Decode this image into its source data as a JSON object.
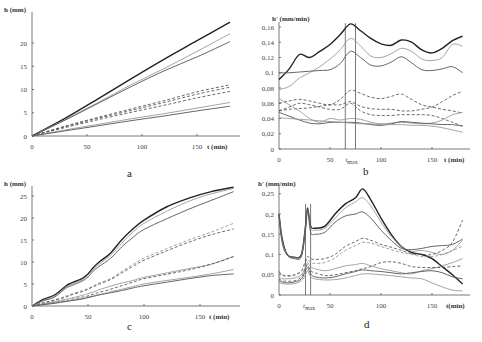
{
  "chart_data": [
    {
      "panel": "a",
      "type": "line",
      "ylabel": "h (mm)",
      "xlabel": "t (min)",
      "xticks": [
        0,
        50,
        100,
        150
      ],
      "yticks": [
        0,
        5,
        10,
        15,
        20
      ],
      "xlim": [
        0,
        180
      ],
      "ylim": [
        0,
        25
      ],
      "grid": false,
      "x": [
        0,
        30,
        60,
        90,
        120,
        150,
        180
      ],
      "series": [
        {
          "name": "s1",
          "style": "solid-bold",
          "values": [
            0,
            3.8,
            8.0,
            12.3,
            16.5,
            20.5,
            24.5
          ]
        },
        {
          "name": "s2",
          "style": "solid-light",
          "values": [
            0,
            3.5,
            7.2,
            11.0,
            14.5,
            18.2,
            22.0
          ]
        },
        {
          "name": "s3",
          "style": "solid",
          "values": [
            0,
            3.4,
            7.0,
            10.6,
            14.0,
            17.0,
            20.3
          ]
        },
        {
          "name": "s4",
          "style": "dashed",
          "values": [
            0,
            2.1,
            4.0,
            5.8,
            7.6,
            9.5,
            11.0
          ]
        },
        {
          "name": "s5",
          "style": "dashed",
          "values": [
            0,
            2.0,
            3.8,
            5.5,
            7.2,
            9.0,
            10.5
          ]
        },
        {
          "name": "s6",
          "style": "dashed",
          "values": [
            0,
            1.8,
            3.5,
            5.1,
            6.6,
            8.2,
            9.6
          ]
        },
        {
          "name": "s7",
          "style": "solid-light",
          "values": [
            0,
            1.3,
            2.5,
            3.7,
            4.8,
            6.0,
            7.2
          ]
        },
        {
          "name": "s8",
          "style": "solid",
          "values": [
            0,
            1.1,
            2.2,
            3.3,
            4.3,
            5.4,
            6.4
          ]
        }
      ]
    },
    {
      "panel": "b",
      "type": "line",
      "ylabel": "h' (mm/min)",
      "xlabel": "t (min)",
      "xticks": [
        0,
        50,
        100,
        150
      ],
      "yticks": [
        "0",
        "0,02",
        "0,04",
        "0,06",
        "0,08",
        "0,1",
        "0,12",
        "0,14",
        "0,16"
      ],
      "xlim": [
        0,
        185
      ],
      "ylim": [
        0,
        0.165
      ],
      "annotation": "t_max",
      "tmax_band": [
        65,
        75
      ],
      "grid": false,
      "x": [
        0,
        10,
        20,
        30,
        40,
        50,
        60,
        70,
        80,
        90,
        100,
        110,
        120,
        130,
        140,
        150,
        160,
        170,
        180
      ],
      "series": [
        {
          "name": "s1",
          "style": "solid-bold",
          "values": [
            0.091,
            0.105,
            0.124,
            0.12,
            0.128,
            0.137,
            0.15,
            0.164,
            0.155,
            0.145,
            0.138,
            0.136,
            0.143,
            0.14,
            0.13,
            0.126,
            0.132,
            0.142,
            0.148
          ]
        },
        {
          "name": "s2",
          "style": "solid-light",
          "values": [
            0.078,
            0.082,
            0.093,
            0.1,
            0.108,
            0.118,
            0.13,
            0.145,
            0.135,
            0.122,
            0.12,
            0.125,
            0.132,
            0.128,
            0.118,
            0.116,
            0.12,
            0.137,
            0.135
          ]
        },
        {
          "name": "s3",
          "style": "solid",
          "values": [
            0.1,
            0.1,
            0.101,
            0.102,
            0.103,
            0.104,
            0.112,
            0.128,
            0.12,
            0.11,
            0.109,
            0.114,
            0.121,
            0.113,
            0.104,
            0.103,
            0.105,
            0.108,
            0.1
          ]
        },
        {
          "name": "s4",
          "style": "dashed",
          "values": [
            0.06,
            0.063,
            0.065,
            0.063,
            0.06,
            0.058,
            0.065,
            0.077,
            0.073,
            0.068,
            0.066,
            0.069,
            0.072,
            0.065,
            0.058,
            0.055,
            0.052,
            0.05,
            0.047
          ]
        },
        {
          "name": "s5",
          "style": "dashed",
          "values": [
            0.05,
            0.052,
            0.053,
            0.054,
            0.056,
            0.058,
            0.058,
            0.062,
            0.056,
            0.053,
            0.052,
            0.052,
            0.05,
            0.05,
            0.052,
            0.055,
            0.062,
            0.07,
            0.076
          ]
        },
        {
          "name": "s6",
          "style": "dashed",
          "values": [
            0.05,
            0.055,
            0.06,
            0.058,
            0.055,
            0.052,
            0.052,
            0.06,
            0.05,
            0.045,
            0.044,
            0.044,
            0.045,
            0.045,
            0.045,
            0.044,
            0.04,
            0.035,
            0.03
          ]
        },
        {
          "name": "s7",
          "style": "solid-light",
          "values": [
            0.066,
            0.058,
            0.05,
            0.04,
            0.035,
            0.04,
            0.038,
            0.04,
            0.039,
            0.035,
            0.033,
            0.034,
            0.035,
            0.034,
            0.033,
            0.034,
            0.038,
            0.045,
            0.048
          ]
        },
        {
          "name": "s8",
          "style": "solid",
          "values": [
            0.048,
            0.043,
            0.038,
            0.034,
            0.033,
            0.035,
            0.035,
            0.035,
            0.034,
            0.032,
            0.031,
            0.033,
            0.036,
            0.035,
            0.034,
            0.033,
            0.032,
            0.032,
            0.03
          ]
        },
        {
          "name": "s9",
          "style": "solid-light",
          "values": [
            0.041,
            0.04,
            0.039,
            0.038,
            0.037,
            0.036,
            0.035,
            0.034,
            0.033,
            0.033,
            0.032,
            0.032,
            0.032,
            0.031,
            0.031,
            0.03,
            0.028,
            0.025,
            0.022
          ]
        }
      ]
    },
    {
      "panel": "c",
      "type": "line",
      "ylabel": "h (mm)",
      "xlabel": "t (min)",
      "xticks": [
        0,
        50,
        100,
        150
      ],
      "yticks": [
        0,
        5,
        10,
        15,
        20,
        25
      ],
      "xlim": [
        0,
        185
      ],
      "ylim": [
        0,
        27
      ],
      "grid": false,
      "x": [
        0,
        10,
        20,
        30,
        35,
        45,
        50,
        55,
        60,
        70,
        80,
        90,
        100,
        120,
        140,
        160,
        180
      ],
      "series": [
        {
          "name": "s1",
          "style": "solid-bold",
          "values": [
            0,
            1.5,
            2.5,
            4.5,
            5.2,
            6.3,
            7.3,
            8.8,
            10.0,
            12.0,
            15.0,
            17.5,
            19.5,
            22.5,
            24.5,
            26.0,
            27.0
          ]
        },
        {
          "name": "s2",
          "style": "solid-light",
          "values": [
            0,
            1.3,
            2.2,
            4.2,
            4.9,
            6.0,
            7.0,
            8.4,
            9.5,
            11.5,
            14.2,
            16.8,
            18.8,
            21.5,
            23.8,
            25.5,
            26.7
          ]
        },
        {
          "name": "s3",
          "style": "solid",
          "values": [
            0,
            1.2,
            2.0,
            4.0,
            4.6,
            5.7,
            6.6,
            8.0,
            9.0,
            10.8,
            13.4,
            15.6,
            17.4,
            19.8,
            22.0,
            24.0,
            26.0
          ]
        },
        {
          "name": "s4",
          "style": "dashed-light",
          "values": [
            0,
            0.8,
            1.4,
            2.2,
            2.7,
            3.5,
            4.0,
            4.6,
            5.2,
            6.2,
            7.8,
            9.4,
            10.9,
            13.0,
            15.0,
            16.8,
            18.8
          ]
        },
        {
          "name": "s5",
          "style": "dashed",
          "values": [
            0,
            0.7,
            1.3,
            2.0,
            2.5,
            3.3,
            3.8,
            4.4,
            5.0,
            6.0,
            7.5,
            9.0,
            10.4,
            12.5,
            14.5,
            16.2,
            17.5
          ]
        },
        {
          "name": "s6",
          "style": "solid-light",
          "values": [
            0,
            0.5,
            1.0,
            1.5,
            1.8,
            2.4,
            2.8,
            3.2,
            3.7,
            4.5,
            5.2,
            5.8,
            6.5,
            7.5,
            8.5,
            9.5,
            11.3
          ]
        },
        {
          "name": "s7",
          "style": "dashed",
          "values": [
            0,
            0.4,
            0.8,
            1.2,
            1.5,
            2.0,
            2.3,
            2.7,
            3.1,
            3.8,
            4.6,
            5.4,
            6.2,
            7.2,
            8.2,
            9.5,
            11.2
          ]
        },
        {
          "name": "s8",
          "style": "solid-light",
          "values": [
            0,
            0.35,
            0.7,
            1.1,
            1.3,
            1.7,
            2.0,
            2.3,
            2.6,
            3.2,
            3.8,
            4.4,
            5.0,
            5.8,
            6.5,
            7.3,
            8.3
          ]
        },
        {
          "name": "s9",
          "style": "solid",
          "values": [
            0,
            0.3,
            0.6,
            1.0,
            1.2,
            1.6,
            1.9,
            2.2,
            2.5,
            3.0,
            3.5,
            4.1,
            4.6,
            5.4,
            6.2,
            6.9,
            7.3
          ]
        }
      ]
    },
    {
      "panel": "d",
      "type": "line",
      "ylabel": "h' (mm/min)",
      "xlabel": "t(min)",
      "xticks": [
        0,
        50,
        100,
        150
      ],
      "yticks": [
        "0",
        "0,05",
        "0,1",
        "0,15",
        "0,2",
        "0,25"
      ],
      "xlim": [
        0,
        185
      ],
      "ylim": [
        0,
        0.27
      ],
      "annotation": "t_max",
      "tmax_band": [
        26,
        31
      ],
      "grid": false,
      "x": [
        0,
        3,
        8,
        15,
        22,
        26,
        28,
        31,
        35,
        45,
        55,
        65,
        75,
        82,
        90,
        100,
        110,
        120,
        130,
        140,
        150,
        160,
        170,
        180
      ],
      "series": [
        {
          "name": "s1",
          "style": "solid-bold",
          "values": [
            0.2,
            0.14,
            0.1,
            0.093,
            0.1,
            0.17,
            0.215,
            0.17,
            0.165,
            0.17,
            0.2,
            0.225,
            0.24,
            0.262,
            0.235,
            0.19,
            0.15,
            0.12,
            0.105,
            0.1,
            0.09,
            0.07,
            0.05,
            0.027
          ]
        },
        {
          "name": "s2",
          "style": "solid-light",
          "values": [
            0.2,
            0.135,
            0.1,
            0.092,
            0.098,
            0.165,
            0.212,
            0.165,
            0.16,
            0.165,
            0.19,
            0.215,
            0.23,
            0.24,
            0.22,
            0.18,
            0.145,
            0.12,
            0.108,
            0.11,
            0.105,
            0.1,
            0.11,
            0.135
          ]
        },
        {
          "name": "s3",
          "style": "solid",
          "values": [
            0.2,
            0.13,
            0.098,
            0.09,
            0.095,
            0.16,
            0.21,
            0.155,
            0.15,
            0.155,
            0.18,
            0.195,
            0.2,
            0.205,
            0.19,
            0.16,
            0.135,
            0.115,
            0.112,
            0.115,
            0.12,
            0.122,
            0.125,
            0.138
          ]
        },
        {
          "name": "s4",
          "style": "dashed",
          "values": [
            0.058,
            0.05,
            0.048,
            0.05,
            0.06,
            0.085,
            0.095,
            0.09,
            0.088,
            0.09,
            0.1,
            0.12,
            0.132,
            0.14,
            0.135,
            0.125,
            0.118,
            0.11,
            0.102,
            0.1,
            0.1,
            0.11,
            0.13,
            0.185
          ]
        },
        {
          "name": "s5",
          "style": "dashed-light",
          "values": [
            0.055,
            0.048,
            0.046,
            0.048,
            0.058,
            0.08,
            0.088,
            0.08,
            0.078,
            0.08,
            0.092,
            0.11,
            0.122,
            0.13,
            0.128,
            0.12,
            0.112,
            0.105,
            0.1,
            0.095,
            0.095,
            0.1,
            0.11,
            0.12
          ]
        },
        {
          "name": "s6",
          "style": "solid-light",
          "values": [
            0.045,
            0.04,
            0.04,
            0.042,
            0.05,
            0.07,
            0.08,
            0.07,
            0.065,
            0.06,
            0.065,
            0.072,
            0.075,
            0.078,
            0.072,
            0.065,
            0.06,
            0.055,
            0.052,
            0.06,
            0.065,
            0.072,
            0.08,
            0.09
          ]
        },
        {
          "name": "s7",
          "style": "dashed",
          "values": [
            0.04,
            0.035,
            0.034,
            0.035,
            0.045,
            0.065,
            0.075,
            0.06,
            0.055,
            0.048,
            0.05,
            0.055,
            0.06,
            0.065,
            0.07,
            0.08,
            0.082,
            0.078,
            0.07,
            0.068,
            0.068,
            0.068,
            0.07,
            0.072
          ]
        },
        {
          "name": "s8",
          "style": "solid",
          "values": [
            0.035,
            0.032,
            0.03,
            0.032,
            0.04,
            0.06,
            0.068,
            0.052,
            0.045,
            0.042,
            0.045,
            0.052,
            0.058,
            0.062,
            0.06,
            0.058,
            0.055,
            0.052,
            0.055,
            0.058,
            0.06,
            0.055,
            0.045,
            0.04
          ]
        },
        {
          "name": "s9",
          "style": "solid-light",
          "values": [
            0.03,
            0.028,
            0.027,
            0.028,
            0.035,
            0.05,
            0.06,
            0.045,
            0.04,
            0.037,
            0.038,
            0.042,
            0.048,
            0.052,
            0.052,
            0.05,
            0.048,
            0.045,
            0.042,
            0.04,
            0.03,
            0.02,
            0.012,
            0.01
          ]
        }
      ]
    }
  ],
  "panels": {
    "a": {
      "caption": "a"
    },
    "b": {
      "caption": "b",
      "tmax_label": "t",
      "tmax_sub": "max"
    },
    "c": {
      "caption": "c"
    },
    "d": {
      "caption": "d",
      "tmax_label": "t",
      "tmax_sub": "max"
    }
  }
}
